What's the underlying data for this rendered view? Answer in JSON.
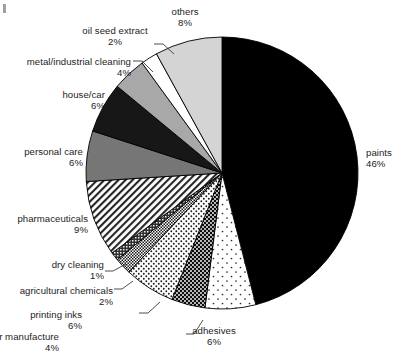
{
  "chart_data": {
    "type": "pie",
    "title": "",
    "subtitle": "",
    "xlabel": "",
    "ylabel": "",
    "legend_position": "none",
    "grid": false,
    "units": "percent",
    "start_angle_deg": 0,
    "direction": "clockwise",
    "categories": [
      "paints",
      "adhesives",
      "rubber/polymer manufacture",
      "printing inks",
      "agricultural chemicals",
      "dry cleaning",
      "pharmaceuticals",
      "personal care",
      "house/car",
      "metal/industrial cleaning",
      "oil seed extract",
      "others"
    ],
    "values": [
      46,
      6,
      4,
      6,
      2,
      1,
      9,
      6,
      6,
      4,
      2,
      8
    ],
    "slices": [
      {
        "label": "paints",
        "value": 46,
        "pct_text": "46%",
        "fill": "#000000",
        "pattern": "solid",
        "label_side": "right",
        "label_align": "l",
        "label_x": 366,
        "label_y": 147,
        "leader": false
      },
      {
        "label": "adhesives",
        "value": 6,
        "pct_text": "6%",
        "fill": "#ffffff",
        "pattern": "dots-sparse",
        "label_side": "bottom",
        "label_align": "c",
        "label_x": 214,
        "label_y": 325,
        "leader": false
      },
      {
        "label": "rubber/polymer manufacture",
        "value": 4,
        "pct_text": "4%",
        "fill": "#ffffff",
        "pattern": "dots-dense-dark",
        "label_side": "bottom",
        "label_align": "r",
        "label_x": 59,
        "label_y": 331,
        "leader": true,
        "leader_path": "M 186 334 L 194 334 L 203 320"
      },
      {
        "label": "printing inks",
        "value": 6,
        "pct_text": "6%",
        "fill": "#ffffff",
        "pattern": "dots-medium",
        "label_side": "bottom",
        "label_align": "r",
        "label_x": 82,
        "label_y": 309,
        "leader": true,
        "leader_path": "M 139 313 L 148 313 L 160 302"
      },
      {
        "label": "agricultural chemicals",
        "value": 2,
        "pct_text": "2%",
        "fill": "#ffffff",
        "pattern": "checks-fine",
        "label_side": "left",
        "label_align": "r",
        "label_x": 113,
        "label_y": 285,
        "leader": true,
        "leader_path": "M 114 289 L 122 289 L 133 281"
      },
      {
        "label": "dry cleaning",
        "value": 1,
        "pct_text": "1%",
        "fill": "#3c3c3c",
        "pattern": "checks-dark",
        "label_side": "left",
        "label_align": "r",
        "label_x": 104,
        "label_y": 259,
        "leader": true,
        "leader_path": "M 105 271 L 113 271 L 126 264"
      },
      {
        "label": "pharmaceuticals",
        "value": 9,
        "pct_text": "9%",
        "fill": "#ffffff",
        "pattern": "diagonal-hatch",
        "label_side": "left",
        "label_align": "r",
        "label_x": 88,
        "label_y": 213,
        "leader": false
      },
      {
        "label": "personal care",
        "value": 6,
        "pct_text": "6%",
        "fill": "#767676",
        "pattern": "solid",
        "label_side": "left",
        "label_align": "r",
        "label_x": 83,
        "label_y": 146,
        "leader": false
      },
      {
        "label": "house/car",
        "value": 6,
        "pct_text": "6%",
        "fill": "#171717",
        "pattern": "solid",
        "label_side": "left",
        "label_align": "r",
        "label_x": 105,
        "label_y": 89,
        "leader": false
      },
      {
        "label": "metal/industrial cleaning",
        "value": 4,
        "pct_text": "4%",
        "fill": "#a8a8a8",
        "pattern": "solid",
        "label_side": "top-left",
        "label_align": "r",
        "label_x": 131,
        "label_y": 56,
        "leader": true,
        "leader_path": "M 133 61 L 142 61 L 153 72"
      },
      {
        "label": "oil seed extract",
        "value": 2,
        "pct_text": "2%",
        "fill": "#ffffff",
        "pattern": "solid",
        "label_side": "top",
        "label_align": "c",
        "label_x": 115,
        "label_y": 25,
        "leader": true,
        "leader_path": "M 154 44 L 163 44 L 174 54"
      },
      {
        "label": "others",
        "value": 8,
        "pct_text": "8%",
        "fill": "#d4d4d4",
        "pattern": "solid",
        "label_side": "top",
        "label_align": "c",
        "label_x": 185,
        "label_y": 6,
        "leader": false
      }
    ],
    "geometry": {
      "center_x": 222,
      "center_y": 173,
      "radius": 136
    },
    "colors": {
      "outline": "#000000",
      "background": "#ffffff",
      "text": "#1d1d1d"
    }
  }
}
